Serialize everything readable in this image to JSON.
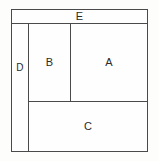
{
  "diagram": {
    "type": "block-partition",
    "canvas": {
      "width": 159,
      "height": 161,
      "background_color": "#fdfdfc"
    },
    "style": {
      "stroke_color": "#4a4a4a",
      "stroke_width": 1,
      "fill_color": "#fefefe",
      "label_color": "#2b2b2b"
    },
    "outer_border": {
      "x": 11,
      "y": 9,
      "width": 137,
      "height": 143
    },
    "regions": [
      {
        "id": "e",
        "label": "E",
        "x": 11,
        "y": 9,
        "width": 137,
        "height": 15,
        "position": "top-full-width-bar"
      },
      {
        "id": "d",
        "label": "D",
        "x": 11,
        "y": 23,
        "width": 18,
        "height": 129,
        "position": "left-narrow-column"
      },
      {
        "id": "b",
        "label": "B",
        "x": 28,
        "y": 23,
        "width": 43,
        "height": 79,
        "position": "middle-upper"
      },
      {
        "id": "a",
        "label": "A",
        "x": 70,
        "y": 23,
        "width": 78,
        "height": 79,
        "position": "right-upper-large"
      },
      {
        "id": "c",
        "label": "C",
        "x": 28,
        "y": 101,
        "width": 120,
        "height": 51,
        "position": "bottom-wide"
      }
    ]
  }
}
